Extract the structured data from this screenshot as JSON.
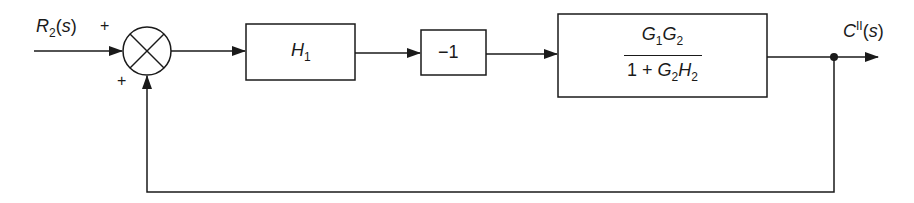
{
  "diagram": {
    "type": "block-diagram",
    "input": {
      "label": "R",
      "sub": "2",
      "arg": "(s)"
    },
    "output": {
      "label": "C",
      "sup": "II",
      "arg": "(s)"
    },
    "summing_junction": {
      "sign_input": "+",
      "sign_feedback": "+"
    },
    "blocks": [
      {
        "id": "H1",
        "label": "H",
        "sub": "1"
      },
      {
        "id": "neg",
        "label": "−1"
      },
      {
        "id": "G",
        "numerator": {
          "a": "G",
          "a_sub": "1",
          "b": "G",
          "b_sub": "2"
        },
        "denominator": {
          "prefix": "1 + ",
          "a": "G",
          "a_sub": "2",
          "b": "H",
          "b_sub": "2"
        }
      }
    ],
    "feedback": "unity positive feedback from output to summing junction",
    "colors": {
      "stroke": "#1a1a1a",
      "background": "#ffffff"
    }
  }
}
